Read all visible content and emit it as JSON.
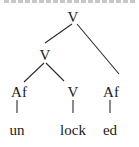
{
  "diagram": {
    "type": "morphological-tree",
    "nodes": [
      {
        "id": "root",
        "label": "V"
      },
      {
        "id": "v-mid",
        "label": "V"
      },
      {
        "id": "af-left",
        "label": "Af"
      },
      {
        "id": "v-low",
        "label": "V"
      },
      {
        "id": "af-right",
        "label": "Af"
      },
      {
        "id": "leaf-un",
        "label": "un"
      },
      {
        "id": "leaf-lock",
        "label": "lock"
      },
      {
        "id": "leaf-ed",
        "label": "ed"
      }
    ],
    "edges": [
      [
        "root",
        "v-mid"
      ],
      [
        "root",
        "af-right"
      ],
      [
        "v-mid",
        "af-left"
      ],
      [
        "v-mid",
        "v-low"
      ],
      [
        "af-left",
        "leaf-un"
      ],
      [
        "v-low",
        "leaf-lock"
      ],
      [
        "af-right",
        "leaf-ed"
      ]
    ]
  }
}
